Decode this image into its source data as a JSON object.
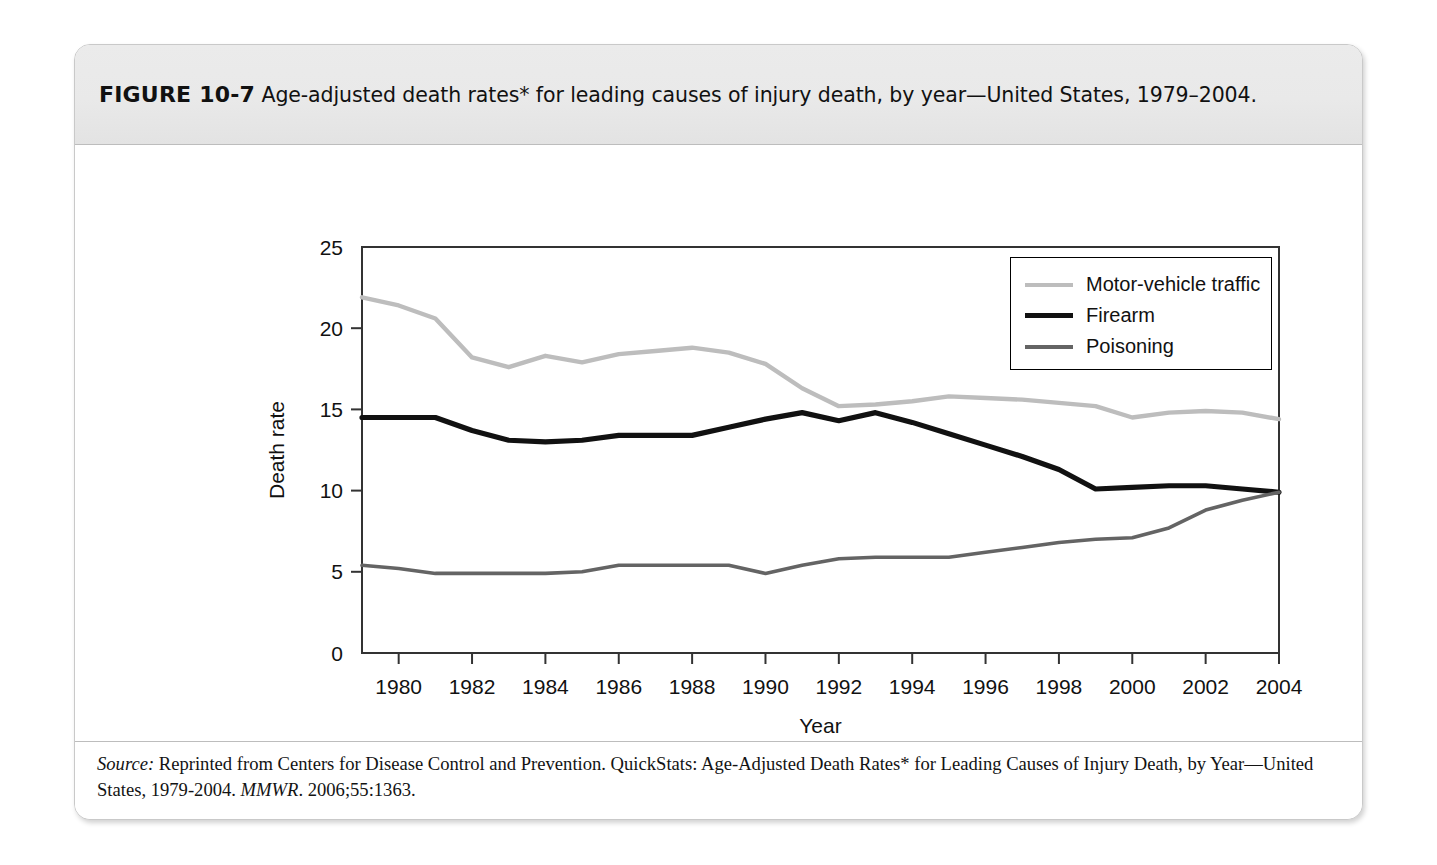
{
  "figure": {
    "number_label": "FIGURE 10-7",
    "caption": "Age-adjusted death rates* for leading causes of injury death, by year—United States, 1979–2004.",
    "footnote": "*Per 100,000 population.",
    "source_prefix": "Source:",
    "source_body_1": " Reprinted from Centers for Disease Control and Prevention. QuickStats: Age-Adjusted Death Rates* for Leading Causes of Injury Death, by Year—United States, 1979-2004. ",
    "source_journal": "MMWR",
    "source_body_2": ". 2006;55:1363."
  },
  "colors": {
    "motor_vehicle": "#bdbdbd",
    "firearm": "#111111",
    "poisoning": "#646464",
    "axis": "#333333",
    "header_band": "#e9e9e9",
    "card_border": "#c9c9c9"
  },
  "chart_data": {
    "type": "line",
    "title": "Age-adjusted death rates* for leading causes of injury death, by year—United States, 1979–2004",
    "xlabel": "Year",
    "ylabel": "Death rate",
    "xlim": [
      1979,
      2004
    ],
    "ylim": [
      0,
      25
    ],
    "yticks": [
      0,
      5,
      10,
      15,
      20,
      25
    ],
    "ytick_labels": [
      "0",
      "5",
      "10",
      "15",
      "20",
      "25"
    ],
    "xticks": [
      1980,
      1982,
      1984,
      1986,
      1988,
      1990,
      1992,
      1994,
      1996,
      1998,
      2000,
      2002,
      2004
    ],
    "xtick_labels": [
      "1980",
      "1982",
      "1984",
      "1986",
      "1988",
      "1990",
      "1992",
      "1994",
      "1996",
      "1998",
      "2000",
      "2002",
      "2004"
    ],
    "grid": false,
    "legend_position": "upper right",
    "x": [
      1979,
      1980,
      1981,
      1982,
      1983,
      1984,
      1985,
      1986,
      1987,
      1988,
      1989,
      1990,
      1991,
      1992,
      1993,
      1994,
      1995,
      1996,
      1997,
      1998,
      1999,
      2000,
      2001,
      2002,
      2003,
      2004
    ],
    "series": [
      {
        "name": "Motor-vehicle traffic",
        "color": "#bdbdbd",
        "values": [
          21.9,
          21.4,
          20.6,
          18.2,
          17.6,
          18.3,
          17.9,
          18.4,
          18.6,
          18.8,
          18.5,
          17.8,
          16.3,
          15.2,
          15.3,
          15.5,
          15.8,
          15.7,
          15.6,
          15.4,
          15.2,
          14.5,
          14.8,
          14.9,
          14.8,
          14.4
        ]
      },
      {
        "name": "Firearm",
        "color": "#111111",
        "values": [
          14.5,
          14.5,
          14.5,
          13.7,
          13.1,
          13.0,
          13.1,
          13.4,
          13.4,
          13.4,
          13.9,
          14.4,
          14.8,
          14.3,
          14.8,
          14.2,
          13.5,
          12.8,
          12.1,
          11.3,
          10.1,
          10.2,
          10.3,
          10.3,
          10.1,
          9.9
        ]
      },
      {
        "name": "Poisoning",
        "color": "#646464",
        "values": [
          5.4,
          5.2,
          4.9,
          4.9,
          4.9,
          4.9,
          5.0,
          5.4,
          5.4,
          5.4,
          5.4,
          4.9,
          5.4,
          5.8,
          5.9,
          5.9,
          5.9,
          6.2,
          6.5,
          6.8,
          7.0,
          7.1,
          7.7,
          8.8,
          9.4,
          9.9
        ]
      }
    ]
  },
  "legend": {
    "items": [
      {
        "label": "Motor-vehicle traffic",
        "color": "#bdbdbd",
        "width": 4
      },
      {
        "label": "Firearm",
        "color": "#111111",
        "width": 5
      },
      {
        "label": "Poisoning",
        "color": "#646464",
        "width": 4
      }
    ]
  }
}
